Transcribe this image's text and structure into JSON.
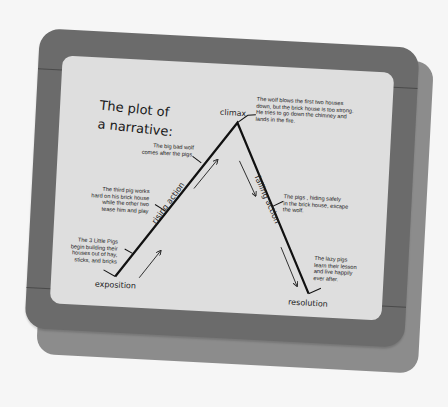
{
  "diagram": {
    "title_line1": "The plot of",
    "title_line2": "a narrative:",
    "stages": {
      "exposition": "exposition",
      "rising_action": "rising action",
      "climax": "climax",
      "falling_action": "falling action",
      "resolution": "resolution"
    },
    "notes": {
      "exposition": "The 3 Little Pigs\nbegin building their\nhouses out of hay,\nsticks, and bricks",
      "rising_1": "The third pig works\nhard on his brick house\nwhile the other two\ntease him and play",
      "rising_2": "The big bad wolf\ncomes after the pigs.",
      "climax": "The wolf blows the first two houses\ndown, but the brick house is too strong.\nHe tries to go down the chimney and\nlands in the fire.",
      "falling": "The pigs , hiding safely\nin the brick house, escape\nthe wolf.",
      "resolution": "The lazy pigs\nlearn their lesson\nand live happily\never after."
    },
    "colors": {
      "background": "#f6f6f6",
      "frame": "#6b6b6b",
      "shadow_board": "#8c8c8c",
      "paper": "#dedede",
      "ink": "#1a1a1a"
    }
  }
}
